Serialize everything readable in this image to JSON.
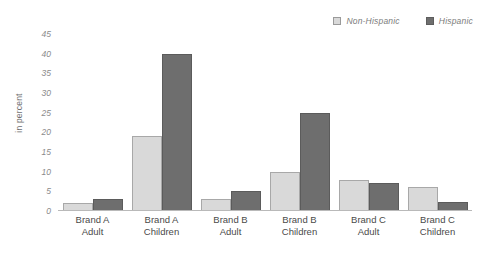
{
  "chart_data": {
    "type": "bar",
    "title": "",
    "xlabel": "",
    "ylabel": "in percent",
    "ylim": [
      0,
      45
    ],
    "yticks": [
      45,
      40,
      35,
      30,
      25,
      20,
      15,
      10,
      5,
      0
    ],
    "grid": false,
    "legend_position": "top-right",
    "categories": [
      "Brand A Adult",
      "Brand A Children",
      "Brand B Adult",
      "Brand B Children",
      "Brand C Adult",
      "Brand C Children"
    ],
    "category_lines": [
      [
        "Brand A",
        "Adult"
      ],
      [
        "Brand A",
        "Children"
      ],
      [
        "Brand B",
        "Adult"
      ],
      [
        "Brand B",
        "Children"
      ],
      [
        "Brand C",
        "Adult"
      ],
      [
        "Brand C",
        "Children"
      ]
    ],
    "series": [
      {
        "name": "Non-Hispanic",
        "color": "#d9d9d9",
        "values": [
          2,
          19,
          3,
          10,
          8,
          6
        ]
      },
      {
        "name": "Hispanic",
        "color": "#6e6e6e",
        "values": [
          3,
          40,
          5,
          25,
          7,
          2.2
        ]
      }
    ]
  },
  "legend": {
    "items": [
      {
        "label": "Non-Hispanic",
        "swatch": "light-swatch-icon"
      },
      {
        "label": "Hispanic",
        "swatch": "dark-swatch-icon"
      }
    ]
  }
}
